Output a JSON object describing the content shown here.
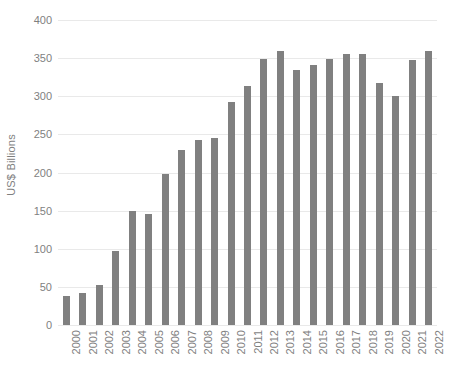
{
  "chart_data": {
    "type": "bar",
    "title": "",
    "subtitle": "",
    "xlabel": "",
    "ylabel": "US$ Billions",
    "ylim": [
      0,
      400
    ],
    "ytick_step": 50,
    "yticks": [
      400,
      350,
      300,
      250,
      200,
      150,
      100,
      50,
      0
    ],
    "grid": true,
    "legend": false,
    "legend_position": "none",
    "bar_color": "#808080",
    "gridline_color": "#e9e9e9",
    "text_color": "#7f7f7f",
    "background_color": "#ffffff",
    "categories": [
      "2000",
      "2001",
      "2002",
      "2003",
      "2004",
      "2005",
      "2006",
      "2007",
      "2008",
      "2009",
      "2010",
      "2011",
      "2012",
      "2013",
      "2014",
      "2015",
      "2016",
      "2017",
      "2018",
      "2019",
      "2020",
      "2021",
      "2022"
    ],
    "values": [
      38,
      42,
      52,
      97,
      150,
      146,
      198,
      229,
      243,
      245,
      292,
      313,
      349,
      360,
      334,
      341,
      349,
      355,
      355,
      318,
      301,
      347,
      360
    ]
  }
}
